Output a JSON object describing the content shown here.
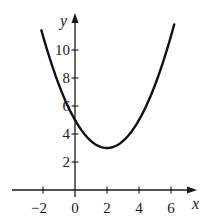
{
  "chart_data": {
    "type": "line",
    "title": "",
    "xlabel": "x",
    "ylabel": "y",
    "xlim": [
      -2.9,
      7.6
    ],
    "ylim": [
      0,
      12.5
    ],
    "grid": false,
    "legend": null,
    "x_ticks": [
      -2,
      0,
      2,
      4,
      6
    ],
    "y_ticks": [
      2,
      4,
      6,
      8,
      10
    ],
    "series": [
      {
        "name": "y = 0.5(x - 2)^2 + 3",
        "color": "#111111",
        "x": [
          -2.1,
          -2,
          -1.5,
          -1,
          -0.5,
          0,
          0.5,
          1,
          1.5,
          2,
          2.5,
          3,
          3.5,
          4,
          4.5,
          5,
          5.5,
          6,
          6.2
        ],
        "y": [
          11.41,
          11,
          9.13,
          7.5,
          6.13,
          5,
          4.13,
          3.5,
          3.13,
          3,
          3.13,
          3.5,
          4.13,
          5,
          6.13,
          7.5,
          9.13,
          11,
          11.82
        ]
      }
    ],
    "annotations": [
      {
        "text": "vertex (2, 3)",
        "visible": false
      }
    ]
  }
}
